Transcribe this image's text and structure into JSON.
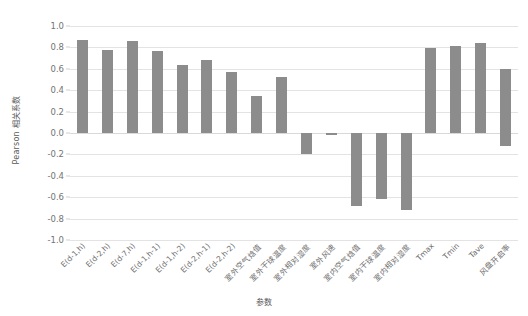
{
  "chart_data": {
    "type": "bar",
    "title": "",
    "xlabel": "参数",
    "ylabel": "Pearson 相关系数",
    "ylim": [
      -1.0,
      1.0
    ],
    "grid": true,
    "legend": "none",
    "orientation": "vertical",
    "bar_color": "#8c8c8c",
    "yticks": [
      "1.0",
      "0.8",
      "0.6",
      "0.4",
      "0.2",
      "0.0",
      "-0.2",
      "-0.4",
      "-0.6",
      "-0.8",
      "-1.0"
    ],
    "ytick_values": [
      1.0,
      0.8,
      0.6,
      0.4,
      0.2,
      0.0,
      -0.2,
      -0.4,
      -0.6,
      -0.8,
      -1.0
    ],
    "categories": [
      "E(d-1,h)",
      "E(d-2,h)",
      "E(d-7,h)",
      "E(d-1,h-1)",
      "E(d-1,h-2)",
      "E(d-2,h-1)",
      "E(d-2,h-2)",
      "室外空气焓值",
      "室外干球温度",
      "室外相对湿度",
      "室外风速",
      "室内空气焓值",
      "室内干球温度",
      "室内相对湿度",
      "Tmax",
      "Tmin",
      "Tave",
      "风盘开启率"
    ],
    "values": [
      0.87,
      0.78,
      0.86,
      0.77,
      0.64,
      0.68,
      0.57,
      0.35,
      0.52,
      -0.2,
      -0.02,
      -0.68,
      -0.62,
      -0.72,
      0.79,
      0.81,
      0.84,
      0.6
    ],
    "negative_extension": {
      "note": "风盘开启率 bar spans from 0.60 down to -0.12",
      "index": 17,
      "low": -0.12,
      "high": 0.6
    }
  }
}
